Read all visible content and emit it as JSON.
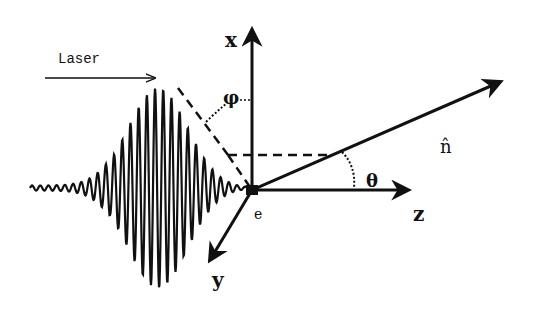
{
  "figure": {
    "labels": {
      "laser": "Laser",
      "x_axis": "x",
      "y_axis": "y",
      "z_axis": "z",
      "electron": "e",
      "phi": "φ",
      "theta": "θ",
      "n_hat": "n̂"
    },
    "colors": {
      "ink": "#111111",
      "background": "#ffffff"
    }
  }
}
